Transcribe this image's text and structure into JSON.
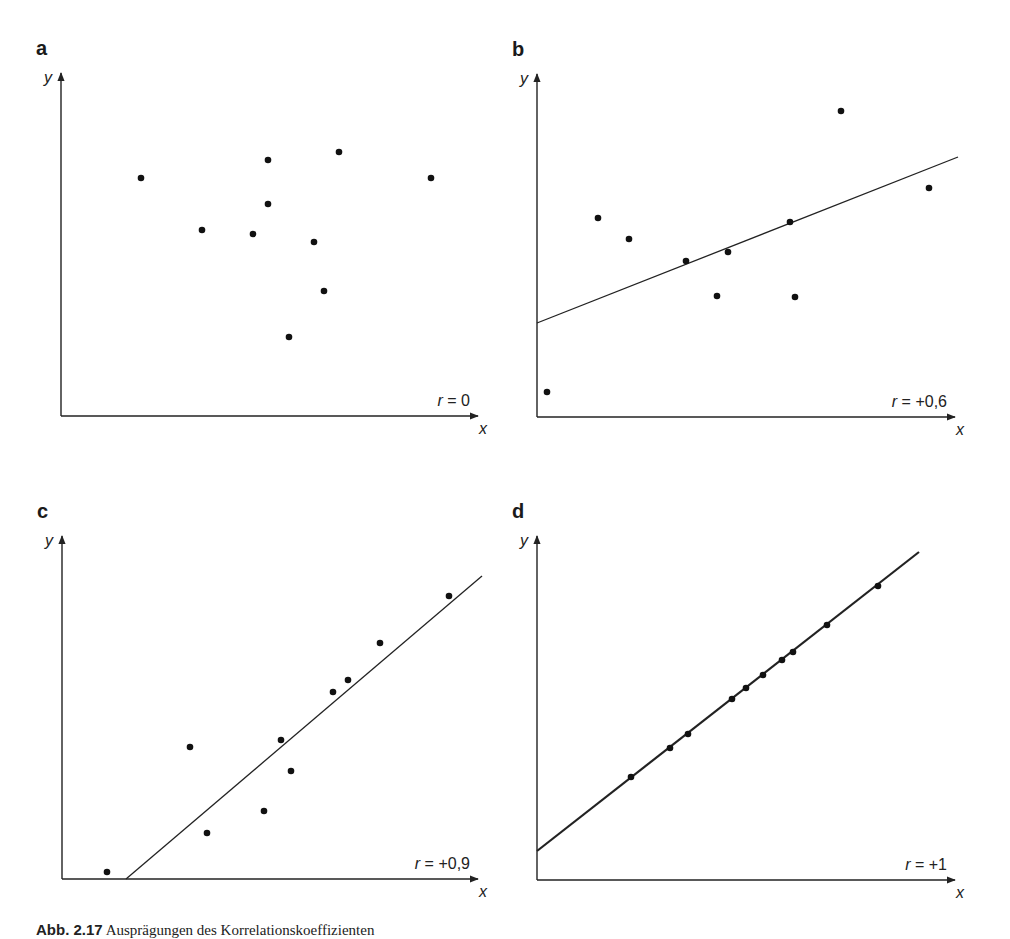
{
  "figure": {
    "caption_prefix": "Abb. 2.17",
    "caption_text": "Ausprägungen des Korrelationskoeffizienten"
  },
  "chart_data": [
    {
      "type": "scatter",
      "panel": "a",
      "title": "a",
      "xlabel": "x",
      "ylabel": "y",
      "annotation": "r = 0",
      "r": 0,
      "regression_line": null,
      "axes": {
        "origin": [
          61,
          416
        ],
        "x_end": 478,
        "y_end": 73
      },
      "points_px": [
        [
          141,
          178
        ],
        [
          202,
          230
        ],
        [
          253,
          234
        ],
        [
          268,
          160
        ],
        [
          268,
          204
        ],
        [
          289,
          337
        ],
        [
          314,
          242
        ],
        [
          324,
          291
        ],
        [
          339,
          152
        ],
        [
          431,
          178
        ]
      ],
      "points": [
        [
          19,
          57
        ],
        [
          34,
          44
        ],
        [
          46,
          43
        ],
        [
          50,
          61
        ],
        [
          50,
          50
        ],
        [
          55,
          19
        ],
        [
          61,
          41
        ],
        [
          63,
          29
        ],
        [
          67,
          64
        ],
        [
          89,
          57
        ]
      ]
    },
    {
      "type": "scatter",
      "panel": "b",
      "title": "b",
      "xlabel": "x",
      "ylabel": "y",
      "annotation": "r = +0,6",
      "r": 0.6,
      "regression_line": {
        "from_px": [
          537,
          323
        ],
        "to_px": [
          958,
          157
        ]
      },
      "axes": {
        "origin": [
          537,
          417
        ],
        "x_end": 955,
        "y_end": 74
      },
      "points_px": [
        [
          547,
          392
        ],
        [
          598,
          218
        ],
        [
          629,
          239
        ],
        [
          686,
          261
        ],
        [
          717,
          296
        ],
        [
          728,
          252
        ],
        [
          790,
          222
        ],
        [
          795,
          297
        ],
        [
          841,
          111
        ],
        [
          929,
          188
        ]
      ],
      "points": [
        [
          2,
          6
        ],
        [
          15,
          50
        ],
        [
          22,
          45
        ],
        [
          36,
          39
        ],
        [
          43,
          30
        ],
        [
          46,
          41
        ],
        [
          61,
          49
        ],
        [
          62,
          30
        ],
        [
          73,
          77
        ],
        [
          94,
          57
        ]
      ]
    },
    {
      "type": "scatter",
      "panel": "c",
      "title": "c",
      "xlabel": "x",
      "ylabel": "y",
      "annotation": "r = +0,9",
      "r": 0.9,
      "regression_line": {
        "from_px": [
          126,
          879
        ],
        "to_px": [
          482,
          576
        ]
      },
      "axes": {
        "origin": [
          62,
          879
        ],
        "x_end": 478,
        "y_end": 536
      },
      "points_px": [
        [
          107,
          872
        ],
        [
          190,
          747
        ],
        [
          207,
          833
        ],
        [
          264,
          811
        ],
        [
          281,
          740
        ],
        [
          291,
          771
        ],
        [
          333,
          692
        ],
        [
          348,
          680
        ],
        [
          380,
          643
        ],
        [
          449,
          596
        ]
      ],
      "points": [
        [
          11,
          2
        ],
        [
          31,
          38
        ],
        [
          35,
          13
        ],
        [
          49,
          20
        ],
        [
          53,
          41
        ],
        [
          55,
          32
        ],
        [
          65,
          55
        ],
        [
          69,
          58
        ],
        [
          77,
          69
        ],
        [
          93,
          82
        ]
      ]
    },
    {
      "type": "scatter",
      "panel": "d",
      "title": "d",
      "xlabel": "x",
      "ylabel": "y",
      "annotation": "r = +1",
      "r": 1,
      "regression_line": {
        "from_px": [
          537,
          851
        ],
        "to_px": [
          919,
          552
        ]
      },
      "axes": {
        "origin": [
          537,
          880
        ],
        "x_end": 955,
        "y_end": 536
      },
      "points_px": [
        [
          631,
          777
        ],
        [
          670,
          748
        ],
        [
          688,
          734
        ],
        [
          732,
          699
        ],
        [
          746,
          688
        ],
        [
          763,
          675
        ],
        [
          782,
          660
        ],
        [
          793,
          652
        ],
        [
          827,
          625
        ],
        [
          878,
          586
        ]
      ],
      "points": [
        [
          22,
          30
        ],
        [
          32,
          38
        ],
        [
          36,
          42
        ],
        [
          47,
          52
        ],
        [
          50,
          56
        ],
        [
          54,
          59
        ],
        [
          59,
          64
        ],
        [
          61,
          66
        ],
        [
          69,
          74
        ],
        [
          82,
          85
        ]
      ]
    }
  ]
}
